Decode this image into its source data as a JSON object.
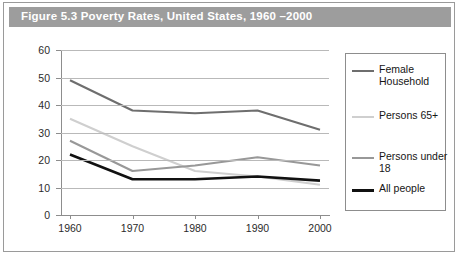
{
  "figure": {
    "title": "Figure 5.3 Poverty Rates, United States, 1960 –2000",
    "title_band_color": "#9d9d9d",
    "title_text_color": "#ffffff",
    "border_color": "#9a9a9a",
    "background_color": "#ffffff"
  },
  "chart_data": {
    "type": "line",
    "title": "Figure 5.3 Poverty Rates, United States, 1960 –2000",
    "xlabel": "",
    "ylabel": "",
    "x": [
      "1960",
      "1970",
      "1980",
      "1990",
      "2000"
    ],
    "categories": [
      "1960",
      "1970",
      "1980",
      "1990",
      "2000"
    ],
    "ylim": [
      0,
      60
    ],
    "ytick_values": [
      "60",
      "50",
      "40",
      "30",
      "20",
      "10",
      "0"
    ],
    "grid": true,
    "legend_position": "right",
    "series": [
      {
        "name": "Female Household",
        "values": [
          49,
          38,
          37,
          38,
          31
        ],
        "color": "#6e6e6e",
        "width": 2.1
      },
      {
        "name": "Persons 65+",
        "values": [
          35,
          25,
          16,
          14,
          11
        ],
        "color": "#cfcfcf",
        "width": 2.1
      },
      {
        "name": "Persons under 18",
        "values": [
          27,
          16,
          18,
          21,
          18
        ],
        "color": "#989898",
        "width": 2.1
      },
      {
        "name": "All people",
        "values": [
          22,
          13,
          13,
          14,
          12.5
        ],
        "color": "#111111",
        "width": 2.6
      }
    ]
  },
  "legend": {
    "entries": [
      {
        "label": "Female Household",
        "color": "#6e6e6e",
        "thickness": 2
      },
      {
        "label": "Persons 65+",
        "color": "#cfcfcf",
        "thickness": 2
      },
      {
        "label": "Persons under 18",
        "color": "#989898",
        "thickness": 2
      },
      {
        "label": "All people",
        "color": "#111111",
        "thickness": 3
      }
    ]
  }
}
